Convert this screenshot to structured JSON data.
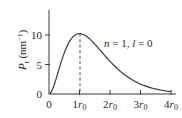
{
  "chart_data": {
    "type": "line",
    "title": "",
    "xlabel": "",
    "ylabel": "P_r (nm^-1)",
    "ylabel_parts": {
      "main": "P",
      "sub": "r",
      "unit": "(nm",
      "sup": "−1",
      "close": ")"
    },
    "xlim": [
      0,
      4
    ],
    "ylim": [
      0,
      14
    ],
    "grid": false,
    "legend": null,
    "x_ticks": [
      {
        "value": 0,
        "label": "0",
        "base": "0",
        "sub": ""
      },
      {
        "value": 1,
        "label": "1r0",
        "base": "1r",
        "sub": "0"
      },
      {
        "value": 2,
        "label": "2r0",
        "base": "2r",
        "sub": "0"
      },
      {
        "value": 3,
        "label": "3r0",
        "base": "3r",
        "sub": "0"
      },
      {
        "value": 4,
        "label": "4r0",
        "base": "4r",
        "sub": "0"
      }
    ],
    "y_ticks": [
      {
        "value": 0,
        "label": "0"
      },
      {
        "value": 5,
        "label": "5"
      },
      {
        "value": 10,
        "label": "10"
      }
    ],
    "annotations": [
      {
        "text": "n = 1, l = 0",
        "parts": {
          "n": "n",
          "eq1": " = 1, ",
          "l": "l",
          "eq2": " = 0"
        }
      },
      {
        "type": "dashed-vline",
        "x": 1,
        "label": "peak at r0"
      }
    ],
    "series": [
      {
        "name": "n=1, l=0 radial probability density",
        "x": [
          0,
          0.25,
          0.5,
          0.75,
          1.0,
          1.25,
          1.5,
          1.75,
          2.0,
          2.25,
          2.5,
          2.75,
          3.0,
          3.25,
          3.5,
          3.75,
          4.0
        ],
        "values": [
          0,
          3.87,
          6.95,
          9.07,
          10.23,
          10.04,
          8.47,
          6.84,
          5.54,
          4.13,
          3.18,
          2.32,
          1.69,
          1.22,
          0.84,
          0.59,
          0.41
        ]
      }
    ],
    "colors": {
      "line": "#3a3a3a",
      "axis": "#3a3a3a"
    }
  }
}
